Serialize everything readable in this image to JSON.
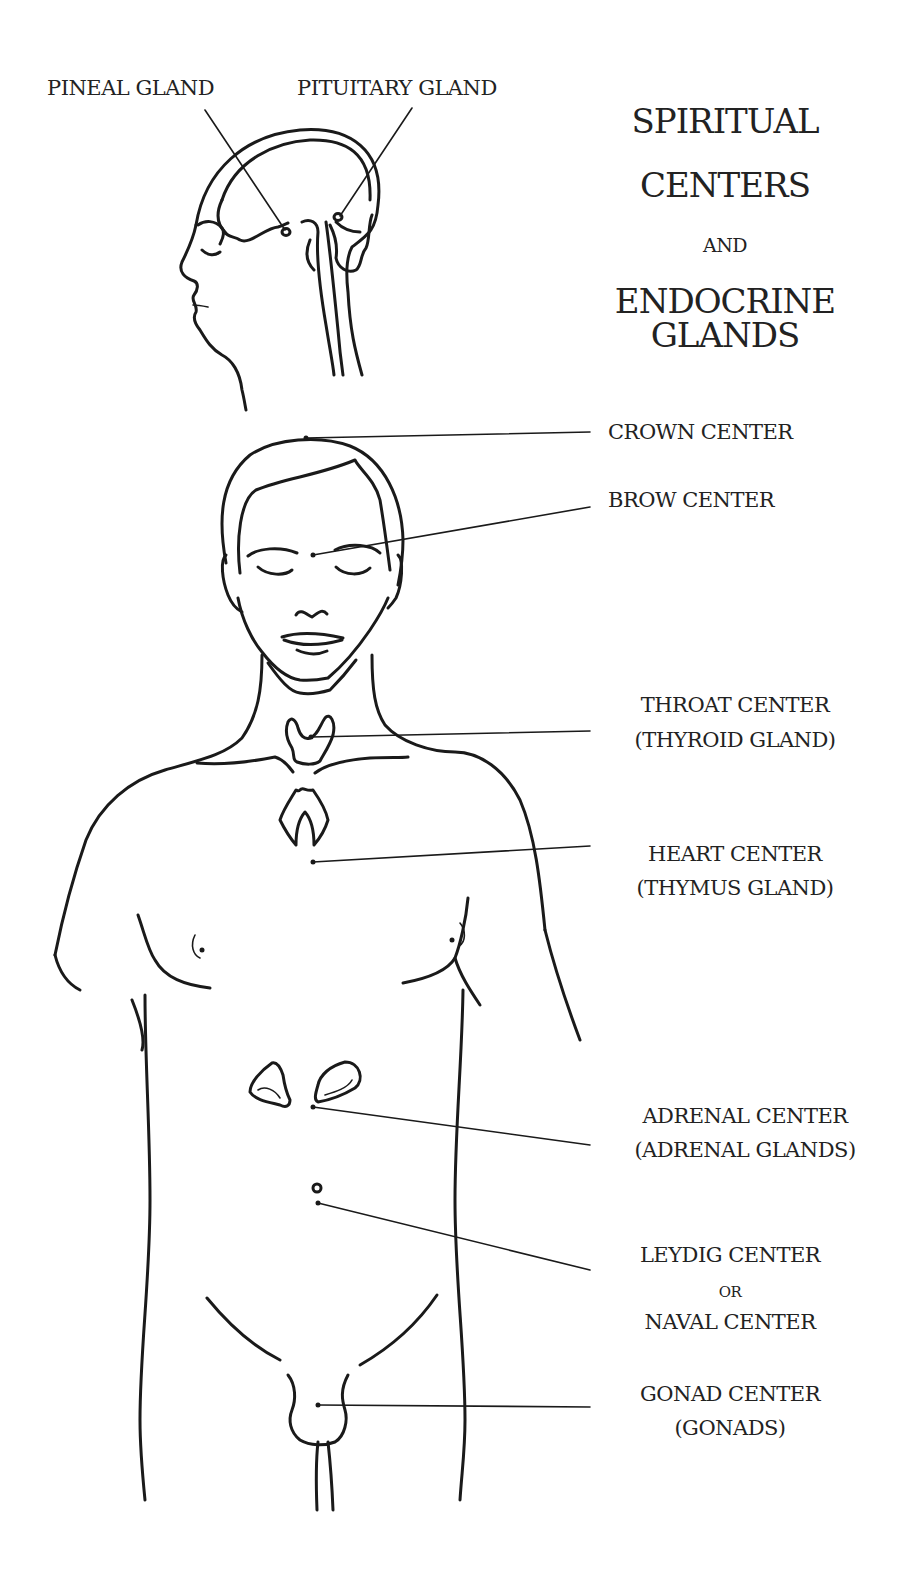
{
  "title": {
    "line1": "SPIRITUAL",
    "line2": "CENTERS",
    "conjunction": "AND",
    "line3": "ENDOCRINE",
    "line4": "GLANDS"
  },
  "head_labels": {
    "pineal": "PINEAL GLAND",
    "pituitary": "PITUITARY GLAND"
  },
  "centers": [
    {
      "name": "CROWN CENTER",
      "gland": ""
    },
    {
      "name": "BROW CENTER",
      "gland": ""
    },
    {
      "name": "THROAT CENTER",
      "gland": "(THYROID GLAND)"
    },
    {
      "name": "HEART CENTER",
      "gland": "(THYMUS GLAND)"
    },
    {
      "name": "ADRENAL CENTER",
      "gland": "(ADRENAL GLANDS)"
    },
    {
      "name": "LEYDIG CENTER",
      "or": "OR",
      "alt": "NAVAL CENTER"
    },
    {
      "name": "GONAD CENTER",
      "gland": "(GONADS)"
    }
  ],
  "colors": {
    "ink": "#1a1a1a",
    "background": "#ffffff"
  }
}
